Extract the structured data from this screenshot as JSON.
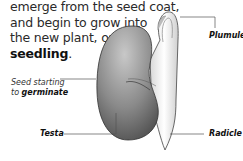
{
  "intro_text": {
    "line1": "emerge from the seed coat,",
    "line2": "and begin to grow into",
    "line3": "the new plant, or",
    "term": "seedling",
    "term_suffix": "."
  },
  "caption": {
    "line1": "Seed starting",
    "line2_prefix": "to ",
    "line2_term": "germinate"
  },
  "labels": {
    "plumule": "Plumule",
    "testa": "Testa",
    "radicle": "Radicle"
  },
  "colors": {
    "seed_dark": "#5a5a5a",
    "seed_light": "#bdbdbd",
    "shoot": "#f4f4f4",
    "leader_line": "#555555",
    "text": "#2a2a2a"
  }
}
